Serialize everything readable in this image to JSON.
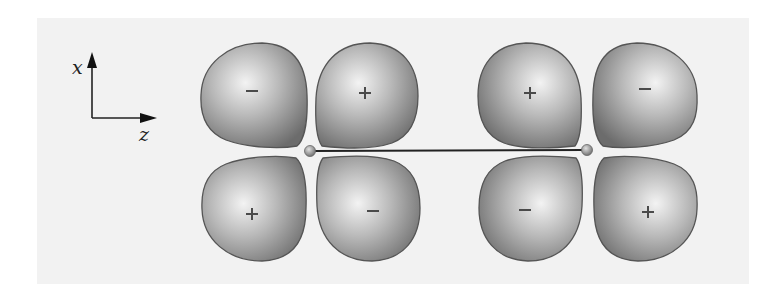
{
  "figure": {
    "title": "",
    "background_panel_color": "#f2f2f2",
    "lobe_base_color": "#8a8a8a",
    "lobe_highlight_color": "#f4f4f4",
    "lobe_outline_color": "#555555",
    "bond_color": "#222222"
  },
  "axes": {
    "vertical_label": "x",
    "horizontal_label": "z"
  },
  "nuclei": [
    {
      "name": "left-nucleus",
      "cx": 310,
      "cy": 151
    },
    {
      "name": "right-nucleus",
      "cx": 587,
      "cy": 150
    }
  ],
  "lobes": [
    {
      "id": "top-1",
      "sign": "−",
      "sign_type": "minus",
      "sign_x": 252,
      "sign_y": 91
    },
    {
      "id": "top-2",
      "sign": "+",
      "sign_type": "plus",
      "sign_x": 365,
      "sign_y": 93
    },
    {
      "id": "top-3",
      "sign": "+",
      "sign_type": "plus",
      "sign_x": 530,
      "sign_y": 93
    },
    {
      "id": "top-4",
      "sign": "−",
      "sign_type": "minus",
      "sign_x": 645,
      "sign_y": 89
    },
    {
      "id": "bottom-1",
      "sign": "+",
      "sign_type": "plus",
      "sign_x": 252,
      "sign_y": 214
    },
    {
      "id": "bottom-2",
      "sign": "−",
      "sign_type": "minus",
      "sign_x": 373,
      "sign_y": 211
    },
    {
      "id": "bottom-3",
      "sign": "−",
      "sign_type": "minus",
      "sign_x": 525,
      "sign_y": 210
    },
    {
      "id": "bottom-4",
      "sign": "+",
      "sign_type": "plus",
      "sign_x": 648,
      "sign_y": 212
    }
  ]
}
